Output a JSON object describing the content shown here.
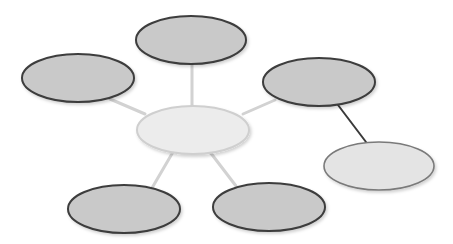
{
  "diagram": {
    "type": "spider-map",
    "width": 453,
    "height": 244,
    "colors": {
      "background": "#ffffff",
      "outer_fill": "#c9c9c9",
      "outer_stroke": "#3d3d3d",
      "center_fill": "#ececec",
      "center_stroke": "#cfcfcf",
      "secondary_fill": "#e4e4e4",
      "secondary_stroke": "#7a7a7a",
      "connector_light": "#d2d2d2",
      "connector_dark": "#3a3a3a",
      "shadow": "#e6e6e6"
    },
    "nodes": [
      {
        "id": "center",
        "cx": 193,
        "cy": 130,
        "rx": 56,
        "ry": 24,
        "style": "center",
        "label": ""
      },
      {
        "id": "top",
        "cx": 191,
        "cy": 40,
        "rx": 55,
        "ry": 24,
        "style": "outer",
        "label": ""
      },
      {
        "id": "left",
        "cx": 78,
        "cy": 78,
        "rx": 56,
        "ry": 24,
        "style": "outer",
        "label": ""
      },
      {
        "id": "right-upper",
        "cx": 319,
        "cy": 82,
        "rx": 56,
        "ry": 24,
        "style": "outer",
        "label": ""
      },
      {
        "id": "right-lower",
        "cx": 379,
        "cy": 166,
        "rx": 55,
        "ry": 24,
        "style": "secondary",
        "label": ""
      },
      {
        "id": "bottom-left",
        "cx": 124,
        "cy": 209,
        "rx": 56,
        "ry": 24,
        "style": "outer",
        "label": ""
      },
      {
        "id": "bottom-right",
        "cx": 269,
        "cy": 207,
        "rx": 56,
        "ry": 24,
        "style": "outer",
        "label": ""
      }
    ],
    "edges": [
      {
        "from": "center",
        "to": "top",
        "x1": 192,
        "y1": 106,
        "x2": 192,
        "y2": 64,
        "style": "light"
      },
      {
        "from": "center",
        "to": "left",
        "x1": 145,
        "y1": 114,
        "x2": 110,
        "y2": 99,
        "style": "light"
      },
      {
        "from": "center",
        "to": "right-upper",
        "x1": 243,
        "y1": 114,
        "x2": 275,
        "y2": 100,
        "style": "light"
      },
      {
        "from": "center",
        "to": "bottom-left",
        "x1": 173,
        "y1": 152,
        "x2": 152,
        "y2": 188,
        "style": "light"
      },
      {
        "from": "center",
        "to": "bottom-right",
        "x1": 210,
        "y1": 152,
        "x2": 236,
        "y2": 186,
        "style": "light"
      },
      {
        "from": "right-upper",
        "to": "right-lower",
        "x1": 338,
        "y1": 105,
        "x2": 366,
        "y2": 142,
        "style": "dark"
      }
    ]
  }
}
